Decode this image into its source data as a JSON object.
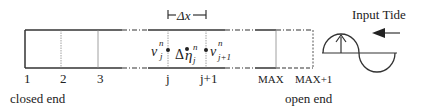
{
  "dx_label": "Δx",
  "input_label": "Input Tide",
  "node_labels": {
    "n1": "1",
    "n2": "2",
    "n3": "3",
    "nj": "j",
    "nj1": "j+1",
    "nmax": "MAX",
    "nmax1": "MAX+1"
  },
  "variables": {
    "v_j": {
      "base": "v",
      "sup": "n",
      "sub": "j"
    },
    "deta_j": {
      "prefix": "Δ",
      "base": "η",
      "sup": "n",
      "sub": "j"
    },
    "v_j1": {
      "base": "v",
      "sup": "n",
      "sub": "j+1"
    }
  },
  "end_labels": {
    "closed": "closed end",
    "open": "open end"
  },
  "colors": {
    "line": "#333333",
    "grid": "#888888",
    "background": "#ffffff"
  }
}
